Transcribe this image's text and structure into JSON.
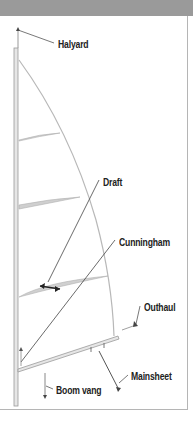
{
  "diagram": {
    "header_color": "#9a9a9a",
    "labels": {
      "halyard": "Halyard",
      "draft": "Draft",
      "cunningham": "Cunningham",
      "outhaul": "Outhaul",
      "mainsheet": "Mainsheet",
      "boom_vang": "Boom vang"
    },
    "parts": [
      "mast",
      "sail",
      "battens",
      "boom",
      "halyard",
      "draft-indicator",
      "cunningham-line",
      "outhaul-line",
      "mainsheet-line",
      "boom-vang-line"
    ]
  }
}
